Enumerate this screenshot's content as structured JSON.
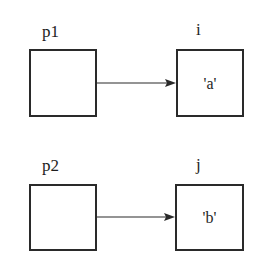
{
  "diagram": {
    "type": "pointer-diagram",
    "rows": [
      {
        "pointer": {
          "name": "p1",
          "value": ""
        },
        "target": {
          "name": "i",
          "value": "'a'"
        },
        "edge": {
          "from": "p1",
          "to": "i",
          "style": "arrow"
        }
      },
      {
        "pointer": {
          "name": "p2",
          "value": ""
        },
        "target": {
          "name": "j",
          "value": "'b'"
        },
        "edge": {
          "from": "p2",
          "to": "j",
          "style": "arrow"
        }
      }
    ],
    "colors": {
      "stroke": "#2a2a2a",
      "text": "#1e1e1e",
      "background": "#ffffff"
    }
  }
}
